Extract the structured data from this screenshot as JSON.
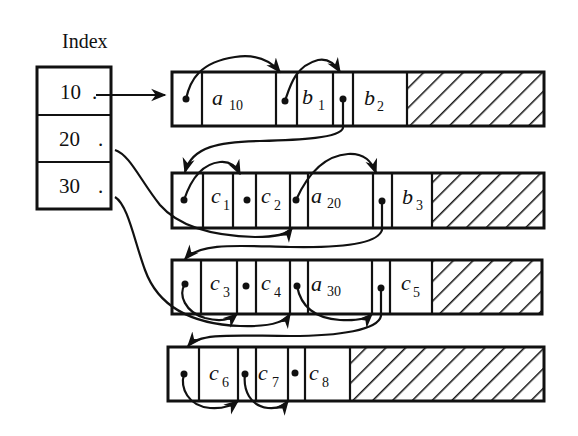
{
  "index": {
    "title": "Index",
    "entries": [
      {
        "key": "10",
        "marker": "."
      },
      {
        "key": "20",
        "marker": "."
      },
      {
        "key": "30",
        "marker": "."
      }
    ]
  },
  "blocks": [
    {
      "name": "block-1",
      "cells": [
        {
          "type": "pointer"
        },
        {
          "type": "data",
          "var": "a",
          "sub": "10"
        },
        {
          "type": "pointer"
        },
        {
          "type": "data",
          "var": "b",
          "sub": "1"
        },
        {
          "type": "pointer"
        },
        {
          "type": "data",
          "var": "b",
          "sub": "2"
        },
        {
          "type": "free"
        }
      ]
    },
    {
      "name": "block-2",
      "cells": [
        {
          "type": "pointer"
        },
        {
          "type": "data",
          "var": "c",
          "sub": "1"
        },
        {
          "type": "pointer"
        },
        {
          "type": "data",
          "var": "c",
          "sub": "2"
        },
        {
          "type": "pointer"
        },
        {
          "type": "data",
          "var": "a",
          "sub": "20"
        },
        {
          "type": "pointer"
        },
        {
          "type": "data",
          "var": "b",
          "sub": "3"
        },
        {
          "type": "free"
        }
      ]
    },
    {
      "name": "block-3",
      "cells": [
        {
          "type": "pointer"
        },
        {
          "type": "data",
          "var": "c",
          "sub": "3"
        },
        {
          "type": "pointer"
        },
        {
          "type": "data",
          "var": "c",
          "sub": "4"
        },
        {
          "type": "pointer"
        },
        {
          "type": "data",
          "var": "a",
          "sub": "30"
        },
        {
          "type": "pointer"
        },
        {
          "type": "data",
          "var": "c",
          "sub": "5"
        },
        {
          "type": "free"
        }
      ]
    },
    {
      "name": "block-4",
      "cells": [
        {
          "type": "pointer"
        },
        {
          "type": "data",
          "var": "c",
          "sub": "6"
        },
        {
          "type": "pointer"
        },
        {
          "type": "data",
          "var": "c",
          "sub": "7"
        },
        {
          "type": "pointer"
        },
        {
          "type": "data",
          "var": "c",
          "sub": "8"
        },
        {
          "type": "free"
        }
      ]
    }
  ],
  "colors": {
    "ink": "#111111",
    "background": "#ffffff"
  }
}
